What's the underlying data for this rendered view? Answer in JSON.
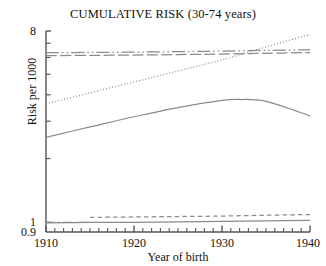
{
  "chart_data": {
    "type": "line",
    "title": "CUMULATIVE RISK (30-74 years)",
    "xlabel": "Year of birth",
    "ylabel": "Risk per 1000",
    "yscale": "log",
    "ylim": [
      0.9,
      8
    ],
    "xlim": [
      1910,
      1940
    ],
    "grid": false,
    "legend": "none",
    "ytick_labels": [
      "8",
      "1",
      "0.9"
    ],
    "ytick_values": [
      8,
      1,
      0.9
    ],
    "xtick_labels": [
      "1910",
      "1920",
      "1930",
      "1940"
    ],
    "xtick_values": [
      1910,
      1920,
      1930,
      1940
    ],
    "axis_color": "#555555",
    "series": [
      {
        "name": "upper-dashdotdot-band",
        "style": "dash-dot-dot",
        "color": "#8a8a8a",
        "x": [
          1910,
          1915,
          1920,
          1925,
          1930,
          1935,
          1940
        ],
        "values": [
          6.32,
          6.34,
          6.36,
          6.39,
          6.43,
          6.48,
          6.52
        ]
      },
      {
        "name": "upper-longdash-band",
        "style": "long-dash",
        "color": "#8a8a8a",
        "x": [
          1910,
          1915,
          1920,
          1925,
          1930,
          1935,
          1940
        ],
        "values": [
          6.12,
          6.14,
          6.16,
          6.19,
          6.23,
          6.28,
          6.33
        ]
      },
      {
        "name": "rising-dotted-trend",
        "style": "dotted",
        "color": "#8e8e8e",
        "x": [
          1910,
          1915,
          1920,
          1925,
          1930,
          1935,
          1940
        ],
        "values": [
          3.62,
          4.08,
          4.6,
          5.18,
          5.85,
          6.72,
          7.72
        ]
      },
      {
        "name": "observed-solid-curve",
        "style": "solid",
        "color": "#8a8a8a",
        "x": [
          1910,
          1915,
          1920,
          1925,
          1930,
          1932,
          1935,
          1940
        ],
        "values": [
          2.52,
          2.82,
          3.15,
          3.48,
          3.76,
          3.8,
          3.72,
          3.18
        ]
      },
      {
        "name": "lower-dash-band",
        "style": "dash",
        "color": "#8a8a8a",
        "x": [
          1915,
          1920,
          1925,
          1930,
          1935,
          1940
        ],
        "values": [
          1.055,
          1.06,
          1.065,
          1.07,
          1.08,
          1.088
        ]
      },
      {
        "name": "lower-solid-band",
        "style": "solid",
        "color": "#8a8a8a",
        "x": [
          1910,
          1915,
          1920,
          1925,
          1930,
          1935,
          1940
        ],
        "values": [
          0.995,
          0.998,
          1.0,
          1.005,
          1.01,
          1.015,
          1.022
        ]
      },
      {
        "name": "lower-dashdot-stub",
        "style": "dash-dot",
        "color": "#8a8a8a",
        "x": [
          1910,
          1912,
          1915
        ],
        "values": [
          1.0,
          1.0,
          1.0
        ]
      }
    ]
  }
}
